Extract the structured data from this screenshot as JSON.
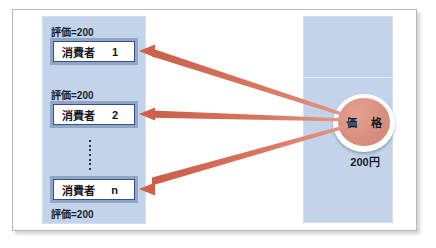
{
  "figure": {
    "colors": {
      "panel_fill": "#c3d4ea",
      "box_border_outer": "#8fa6cb",
      "box_border_inner": "#3c4f78",
      "arrow": "#cf6a52",
      "ellipse_fill": "#d98f7f",
      "frame_border": "#b9b9b9",
      "text": "#12161f"
    }
  },
  "left_panel": {
    "name": "consumers-panel",
    "consumers": [
      {
        "valuation_label": "評価=200",
        "valuation_position": "above",
        "box_label": "消費者",
        "box_index": "1"
      },
      {
        "valuation_label": "評価=200",
        "valuation_position": "above",
        "box_label": "消費者",
        "box_index": "2"
      },
      {
        "valuation_label": "評価=200",
        "valuation_position": "below",
        "box_label": "消費者",
        "box_index": "n"
      }
    ],
    "ellipsis": "⋮"
  },
  "right_panel": {
    "name": "price-panel",
    "ellipse_label": "価 格",
    "amount": "200円"
  },
  "arrows": {
    "count": 3,
    "direction": "right-to-left",
    "description": "price points to each consumer"
  }
}
